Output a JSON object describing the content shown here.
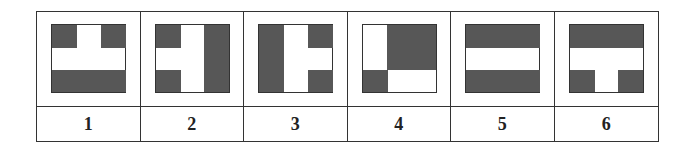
{
  "colors": {
    "dark": "#575757",
    "border": "#333333",
    "background": "#ffffff"
  },
  "figures": [
    {
      "label": "1",
      "grid": [
        [
          1,
          0,
          1
        ],
        [
          0,
          0,
          0
        ],
        [
          1,
          1,
          1
        ]
      ]
    },
    {
      "label": "2",
      "grid": [
        [
          1,
          0,
          1
        ],
        [
          0,
          0,
          1
        ],
        [
          1,
          0,
          1
        ]
      ]
    },
    {
      "label": "3",
      "grid": [
        [
          1,
          0,
          1
        ],
        [
          1,
          0,
          0
        ],
        [
          1,
          0,
          1
        ]
      ]
    },
    {
      "label": "4",
      "grid": [
        [
          0,
          1,
          1
        ],
        [
          0,
          1,
          1
        ],
        [
          1,
          0,
          0
        ]
      ]
    },
    {
      "label": "5",
      "grid": [
        [
          1,
          1,
          1
        ],
        [
          0,
          0,
          0
        ],
        [
          1,
          1,
          1
        ]
      ]
    },
    {
      "label": "6",
      "grid": [
        [
          1,
          1,
          1
        ],
        [
          0,
          0,
          0
        ],
        [
          1,
          0,
          1
        ]
      ]
    }
  ]
}
